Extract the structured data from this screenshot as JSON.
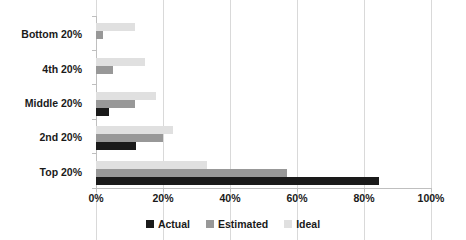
{
  "chart_data": {
    "type": "bar",
    "orientation": "horizontal",
    "title": "",
    "xlabel": "",
    "ylabel": "",
    "xlim": [
      0,
      100
    ],
    "xticks": [
      "0%",
      "20%",
      "40%",
      "60%",
      "80%",
      "100%"
    ],
    "xtick_values": [
      0,
      20,
      40,
      60,
      80,
      100
    ],
    "grid": true,
    "legend_position": "bottom",
    "categories": [
      "Bottom 20%",
      "4th 20%",
      "Middle 20%",
      "2nd 20%",
      "Top 20%"
    ],
    "series": [
      {
        "name": "Actual",
        "color": "#1a1a1a",
        "values": [
          0,
          0,
          4,
          12,
          84.5
        ]
      },
      {
        "name": "Estimated",
        "color": "#989898",
        "values": [
          2,
          5,
          11.5,
          20,
          57
        ]
      },
      {
        "name": "Ideal",
        "color": "#e0e0e0",
        "values": [
          11.5,
          14.5,
          18,
          23,
          33
        ]
      }
    ]
  },
  "axis": {
    "line_color": "#bfbfbf",
    "grid_color": "#d9d9d9"
  }
}
